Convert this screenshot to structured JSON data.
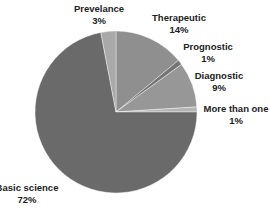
{
  "chart_data": {
    "type": "pie",
    "title": "",
    "start_angle": "12 o'clock, clockwise",
    "categories": [
      "Therapeutic",
      "Prognostic",
      "Diagnostic",
      "More than one",
      "Basic science",
      "Prevelance"
    ],
    "values": [
      14,
      1,
      9,
      1,
      72,
      3
    ],
    "value_labels": [
      "14%",
      "1%",
      "9%",
      "1%",
      "72%",
      "3%"
    ],
    "colors": [
      "#8f8f8f",
      "#757575",
      "#979797",
      "#b4b4b4",
      "#6a6a6a",
      "#a9a9a9"
    ],
    "legend": "none (data labels outside slices)"
  },
  "labels": [
    {
      "name": "Prevelance",
      "pct": "3%",
      "x": 99,
      "y": 3
    },
    {
      "name": "Therapeutic",
      "pct": "14%",
      "x": 179,
      "y": 12
    },
    {
      "name": "Prognostic",
      "pct": "1%",
      "x": 208,
      "y": 41
    },
    {
      "name": "Diagnostic",
      "pct": "9%",
      "x": 219,
      "y": 70
    },
    {
      "name": "More than one",
      "pct": "1%",
      "x": 236,
      "y": 103
    },
    {
      "name": "Basic science",
      "pct": "72%",
      "x": 27,
      "y": 182
    }
  ]
}
